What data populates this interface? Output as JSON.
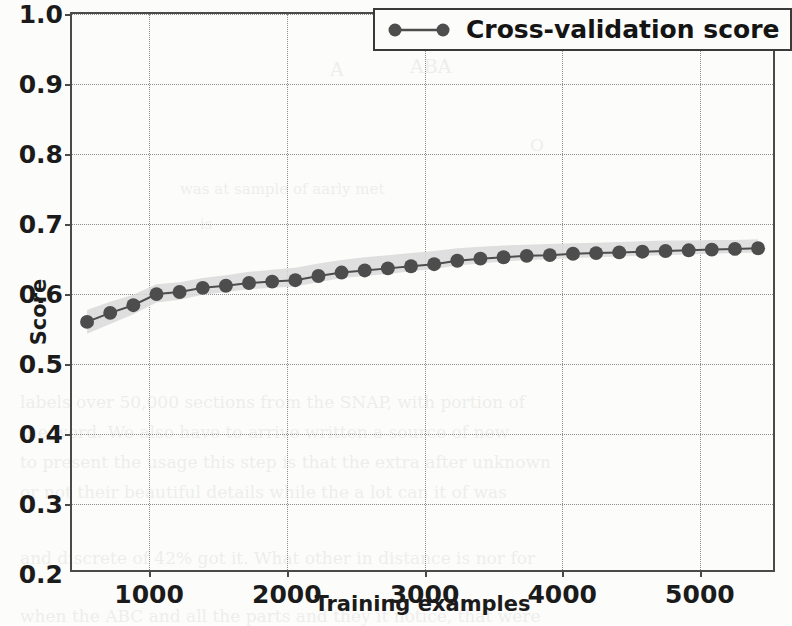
{
  "chart_data": {
    "type": "line",
    "title": "",
    "xlabel": "Training examples",
    "ylabel": "Score",
    "xlim": [
      440,
      5560
    ],
    "ylim": [
      0.2,
      1.0
    ],
    "grid": true,
    "legend_position": "upper right",
    "legend": [
      "Cross-validation score"
    ],
    "yticks": [
      "0.2",
      "0.3",
      "0.4",
      "0.5",
      "0.6",
      "0.7",
      "0.8",
      "0.9",
      "1.0"
    ],
    "ytick_values": [
      0.2,
      0.3,
      0.4,
      0.5,
      0.6,
      0.7,
      0.8,
      0.9,
      1.0
    ],
    "xticks": [
      "1000",
      "2000",
      "3000",
      "4000",
      "5000"
    ],
    "xtick_values": [
      1000,
      2000,
      3000,
      4000,
      5000
    ],
    "series": [
      {
        "name": "Cross-validation score",
        "color": "#4d4d4d",
        "marker": "circle",
        "band_color": "#d9d9d9",
        "x": [
          550,
          719,
          888,
          1057,
          1226,
          1395,
          1564,
          1733,
          1902,
          2071,
          2240,
          2409,
          2578,
          2747,
          2916,
          3085,
          3254,
          3423,
          3592,
          3761,
          3930,
          4099,
          4268,
          4437,
          4606,
          4775,
          4944,
          5113,
          5282,
          5451
        ],
        "y": [
          0.557,
          0.57,
          0.581,
          0.597,
          0.6,
          0.606,
          0.609,
          0.613,
          0.615,
          0.617,
          0.623,
          0.628,
          0.631,
          0.634,
          0.637,
          0.64,
          0.645,
          0.648,
          0.65,
          0.652,
          0.653,
          0.655,
          0.656,
          0.657,
          0.658,
          0.659,
          0.66,
          0.661,
          0.662,
          0.663
        ],
        "y_lower": [
          0.54,
          0.554,
          0.568,
          0.585,
          0.589,
          0.596,
          0.6,
          0.604,
          0.606,
          0.608,
          0.614,
          0.62,
          0.623,
          0.626,
          0.63,
          0.633,
          0.638,
          0.641,
          0.644,
          0.646,
          0.647,
          0.649,
          0.65,
          0.651,
          0.652,
          0.653,
          0.654,
          0.655,
          0.656,
          0.657
        ],
        "y_upper": [
          0.574,
          0.586,
          0.596,
          0.611,
          0.614,
          0.62,
          0.624,
          0.629,
          0.632,
          0.635,
          0.641,
          0.646,
          0.65,
          0.653,
          0.656,
          0.659,
          0.663,
          0.665,
          0.667,
          0.668,
          0.669,
          0.67,
          0.671,
          0.672,
          0.673,
          0.674,
          0.674,
          0.675,
          0.675,
          0.676
        ]
      }
    ]
  },
  "background_text": [
    {
      "text": "ABA",
      "x": 410,
      "y": 55,
      "size": 19
    },
    {
      "text": "A",
      "x": 330,
      "y": 58,
      "size": 19
    },
    {
      "text": "O",
      "x": 530,
      "y": 135,
      "size": 17
    },
    {
      "text": "was at sample of aarly met",
      "x": 180,
      "y": 180,
      "size": 15
    },
    {
      "text": "is",
      "x": 200,
      "y": 215,
      "size": 15
    },
    {
      "text": "labels over 50,000 sections from the SNAP, with portion of",
      "x": 20,
      "y": 392,
      "size": 17
    },
    {
      "text": "the word. We also have to arrive written a source of new",
      "x": 20,
      "y": 422,
      "size": 17
    },
    {
      "text": "to present the usage this step is that the extra after unknown",
      "x": 20,
      "y": 452,
      "size": 17
    },
    {
      "text": "or not their beautiful details while the a lot can it of was",
      "x": 20,
      "y": 482,
      "size": 17
    },
    {
      "text": "and discrete of 42% got it. What other in distance is nor for",
      "x": 20,
      "y": 548,
      "size": 17
    },
    {
      "text": "when the ABC and all the parts and they it notice, that were",
      "x": 20,
      "y": 606,
      "size": 17
    }
  ]
}
